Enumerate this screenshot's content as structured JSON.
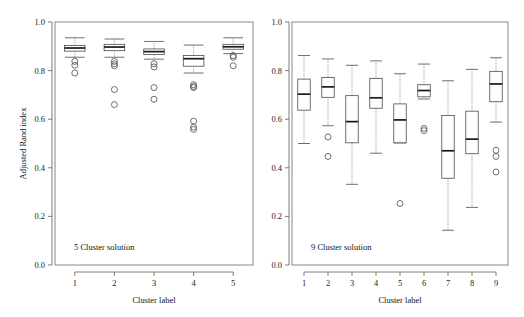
{
  "figure": {
    "width": 524,
    "height": 317,
    "background": "#ffffff",
    "stroke_color": "#555555",
    "median_color": "#1a1a1a",
    "whisker_color": "#8a8a8a"
  },
  "chart_data": [
    {
      "type": "box",
      "panel_id": "left",
      "title": "",
      "annotation": "5 Cluster solution",
      "xlabel": "Cluster label",
      "ylabel": "Adjusted Rand index",
      "ylim": [
        0.0,
        1.0
      ],
      "yticks": [
        0.0,
        0.2,
        0.4,
        0.6,
        0.8,
        1.0
      ],
      "yticklabels": [
        "0.0",
        "0.2",
        "0.4",
        "0.6",
        "0.8",
        "1.0"
      ],
      "categories": [
        "1",
        "2",
        "3",
        "4",
        "5"
      ],
      "grid": false,
      "legend": "none",
      "boxes": [
        {
          "label": "1",
          "whisker_low": 0.855,
          "q1": 0.88,
          "median": 0.893,
          "q3": 0.903,
          "whisker_high": 0.935,
          "outliers": [
            0.838,
            0.822,
            0.79
          ]
        },
        {
          "label": "2",
          "whisker_low": 0.855,
          "q1": 0.882,
          "median": 0.897,
          "q3": 0.908,
          "whisker_high": 0.93,
          "outliers": [
            0.838,
            0.828,
            0.82,
            0.722,
            0.66
          ]
        },
        {
          "label": "3",
          "whisker_low": 0.847,
          "q1": 0.866,
          "median": 0.878,
          "q3": 0.889,
          "whisker_high": 0.92,
          "outliers": [
            0.828,
            0.815,
            0.73,
            0.682
          ]
        },
        {
          "label": "4",
          "whisker_low": 0.79,
          "q1": 0.818,
          "median": 0.849,
          "q3": 0.862,
          "whisker_high": 0.905,
          "outliers": [
            0.742,
            0.735,
            0.73,
            0.592,
            0.567,
            0.558
          ]
        },
        {
          "label": "5",
          "whisker_low": 0.87,
          "q1": 0.888,
          "median": 0.898,
          "q3": 0.908,
          "whisker_high": 0.935,
          "outliers": [
            0.862,
            0.855,
            0.82
          ]
        }
      ]
    },
    {
      "type": "box",
      "panel_id": "right",
      "title": "",
      "annotation": "9 Cluster solution",
      "xlabel": "Cluster label",
      "ylabel": "",
      "ylim": [
        0.0,
        1.0
      ],
      "yticks": [
        0.0,
        0.2,
        0.4,
        0.6,
        0.8,
        1.0
      ],
      "yticklabels": [
        "0.0",
        "0.2",
        "0.4",
        "0.6",
        "0.8",
        "1.0"
      ],
      "categories": [
        "1",
        "2",
        "3",
        "4",
        "5",
        "6",
        "7",
        "8",
        "9"
      ],
      "grid": false,
      "legend": "none",
      "boxes": [
        {
          "label": "1",
          "whisker_low": 0.5,
          "q1": 0.637,
          "median": 0.703,
          "q3": 0.765,
          "whisker_high": 0.862,
          "outliers": []
        },
        {
          "label": "2",
          "whisker_low": 0.573,
          "q1": 0.69,
          "median": 0.733,
          "q3": 0.772,
          "whisker_high": 0.848,
          "outliers": [
            0.527,
            0.447
          ]
        },
        {
          "label": "3",
          "whisker_low": 0.332,
          "q1": 0.503,
          "median": 0.59,
          "q3": 0.697,
          "whisker_high": 0.822,
          "outliers": []
        },
        {
          "label": "4",
          "whisker_low": 0.46,
          "q1": 0.645,
          "median": 0.688,
          "q3": 0.768,
          "whisker_high": 0.84,
          "outliers": []
        },
        {
          "label": "5",
          "whisker_low": 0.502,
          "q1": 0.503,
          "median": 0.597,
          "q3": 0.663,
          "whisker_high": 0.787,
          "outliers": [
            0.253
          ]
        },
        {
          "label": "6",
          "whisker_low": 0.683,
          "q1": 0.692,
          "median": 0.718,
          "q3": 0.742,
          "whisker_high": 0.827,
          "outliers": [
            0.562,
            0.553
          ]
        },
        {
          "label": "7",
          "whisker_low": 0.143,
          "q1": 0.357,
          "median": 0.47,
          "q3": 0.615,
          "whisker_high": 0.758,
          "outliers": []
        },
        {
          "label": "8",
          "whisker_low": 0.237,
          "q1": 0.458,
          "median": 0.518,
          "q3": 0.633,
          "whisker_high": 0.805,
          "outliers": []
        },
        {
          "label": "9",
          "whisker_low": 0.588,
          "q1": 0.672,
          "median": 0.745,
          "q3": 0.797,
          "whisker_high": 0.853,
          "outliers": [
            0.472,
            0.447,
            0.383
          ]
        }
      ]
    }
  ]
}
